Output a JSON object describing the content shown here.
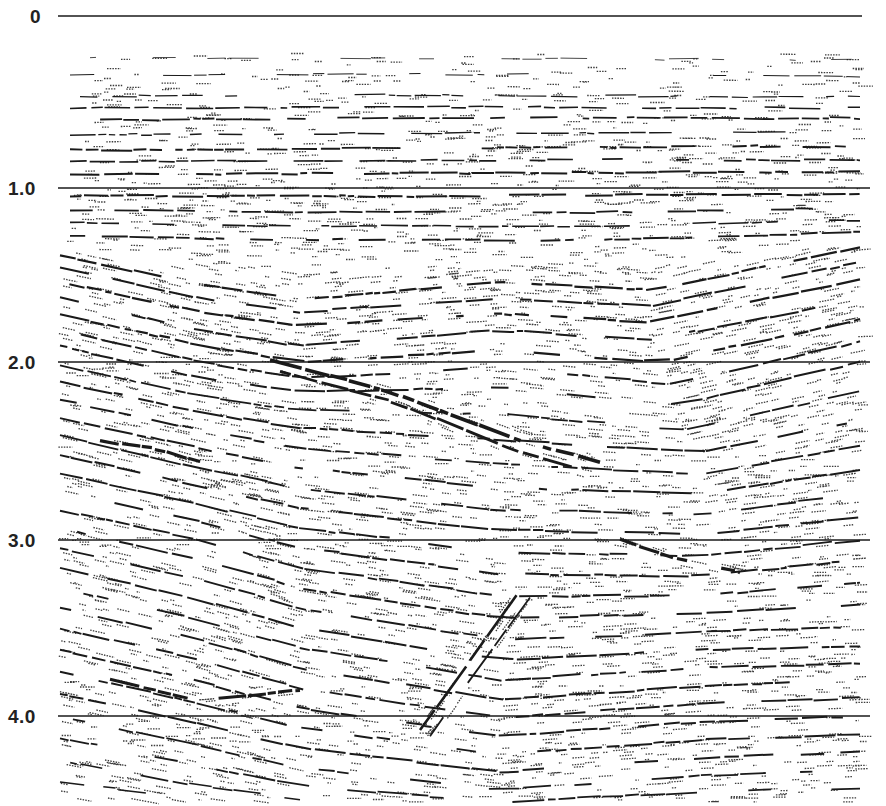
{
  "figure": {
    "type": "seismic-reflection-section",
    "background": "#ffffff",
    "ink": "#1a1a1a",
    "axis": {
      "label_axis": "two-way travel time (s)",
      "ticks": [
        {
          "label": "0",
          "value": 0.0,
          "y": 16,
          "label_x": 30
        },
        {
          "label": "1.0",
          "value": 1.0,
          "y": 188,
          "label_x": 8
        },
        {
          "label": "2.0",
          "value": 2.0,
          "y": 362,
          "label_x": 8
        },
        {
          "label": "3.0",
          "value": 3.0,
          "y": 540,
          "label_x": 8
        },
        {
          "label": "4.0",
          "value": 4.0,
          "y": 716,
          "label_x": 8
        }
      ],
      "timing_line_x": [
        58,
        870
      ],
      "zero_line_x": [
        58,
        862
      ]
    },
    "data_area": {
      "x0": 58,
      "x1": 870,
      "y0": 45,
      "y1": 802
    },
    "zones": [
      {
        "name": "shallow-flat-layers",
        "y_range": [
          45,
          250
        ],
        "dip": "near-horizontal",
        "density": "sparse-to-moderate"
      },
      {
        "name": "dipping-package-left",
        "y_range": [
          250,
          360
        ],
        "dip": "down-to-right"
      },
      {
        "name": "chaotic-central-zone",
        "x_range": [
          280,
          560
        ],
        "y_range": [
          230,
          350
        ]
      },
      {
        "name": "strong-dipping-reflector",
        "from": [
          390,
          395
        ],
        "to": [
          600,
          460
        ]
      },
      {
        "name": "deep-cross-cutting-event",
        "from": [
          420,
          730
        ],
        "to": [
          520,
          590
        ]
      }
    ],
    "horizons": [
      {
        "pts": [
          [
            90,
            58
          ],
          [
            400,
            58
          ],
          [
            860,
            60
          ]
        ],
        "w": 0.8,
        "gap": 0.55
      },
      {
        "pts": [
          [
            70,
            75
          ],
          [
            400,
            74
          ],
          [
            860,
            76
          ]
        ],
        "w": 1.0,
        "gap": 0.45
      },
      {
        "pts": [
          [
            80,
            96
          ],
          [
            400,
            95
          ],
          [
            860,
            97
          ]
        ],
        "w": 1.2,
        "gap": 0.35
      },
      {
        "pts": [
          [
            70,
            108
          ],
          [
            400,
            107
          ],
          [
            860,
            108
          ]
        ],
        "w": 1.6,
        "gap": 0.25
      },
      {
        "pts": [
          [
            70,
            120
          ],
          [
            400,
            118
          ],
          [
            860,
            118
          ]
        ],
        "w": 1.8,
        "gap": 0.2
      },
      {
        "pts": [
          [
            70,
            135
          ],
          [
            400,
            133
          ],
          [
            860,
            132
          ]
        ],
        "w": 1.4,
        "gap": 0.3
      },
      {
        "pts": [
          [
            70,
            150
          ],
          [
            400,
            148
          ],
          [
            860,
            146
          ]
        ],
        "w": 1.9,
        "gap": 0.2
      },
      {
        "pts": [
          [
            70,
            162
          ],
          [
            400,
            160
          ],
          [
            860,
            160
          ]
        ],
        "w": 1.7,
        "gap": 0.22
      },
      {
        "pts": [
          [
            70,
            175
          ],
          [
            400,
            173
          ],
          [
            860,
            172
          ]
        ],
        "w": 2.0,
        "gap": 0.15
      },
      {
        "pts": [
          [
            70,
            196
          ],
          [
            400,
            196
          ],
          [
            860,
            194
          ]
        ],
        "w": 2.0,
        "gap": 0.15
      },
      {
        "pts": [
          [
            70,
            210
          ],
          [
            300,
            212
          ],
          [
            600,
            212
          ],
          [
            860,
            208
          ]
        ],
        "w": 1.8,
        "gap": 0.2
      },
      {
        "pts": [
          [
            70,
            222
          ],
          [
            300,
            226
          ],
          [
            600,
            226
          ],
          [
            860,
            220
          ]
        ],
        "w": 1.6,
        "gap": 0.25
      },
      {
        "pts": [
          [
            70,
            236
          ],
          [
            300,
            240
          ],
          [
            600,
            240
          ],
          [
            860,
            232
          ]
        ],
        "w": 1.9,
        "gap": 0.2
      },
      {
        "pts": [
          [
            60,
            255
          ],
          [
            200,
            285
          ],
          [
            300,
            300
          ],
          [
            500,
            282
          ],
          [
            650,
            290
          ],
          [
            860,
            248
          ]
        ],
        "w": 2.2,
        "gap": 0.2
      },
      {
        "pts": [
          [
            60,
            268
          ],
          [
            200,
            298
          ],
          [
            300,
            312
          ],
          [
            500,
            298
          ],
          [
            650,
            306
          ],
          [
            860,
            262
          ]
        ],
        "w": 2.0,
        "gap": 0.25
      },
      {
        "pts": [
          [
            60,
            282
          ],
          [
            200,
            312
          ],
          [
            300,
            326
          ],
          [
            500,
            314
          ],
          [
            650,
            322
          ],
          [
            860,
            280
          ]
        ],
        "w": 2.2,
        "gap": 0.2
      },
      {
        "pts": [
          [
            60,
            298
          ],
          [
            200,
            330
          ],
          [
            300,
            346
          ],
          [
            500,
            330
          ],
          [
            650,
            340
          ],
          [
            860,
            300
          ]
        ],
        "w": 2.0,
        "gap": 0.25
      },
      {
        "pts": [
          [
            60,
            315
          ],
          [
            200,
            345
          ],
          [
            300,
            362
          ],
          [
            500,
            350
          ],
          [
            660,
            362
          ],
          [
            860,
            320
          ]
        ],
        "w": 2.2,
        "gap": 0.2
      },
      {
        "pts": [
          [
            60,
            330
          ],
          [
            200,
            362
          ],
          [
            300,
            378
          ],
          [
            500,
            368
          ],
          [
            670,
            384
          ],
          [
            860,
            342
          ]
        ],
        "w": 2.0,
        "gap": 0.25
      },
      {
        "pts": [
          [
            60,
            346
          ],
          [
            200,
            378
          ],
          [
            300,
            392
          ],
          [
            500,
            388
          ],
          [
            680,
            404
          ],
          [
            860,
            362
          ]
        ],
        "w": 2.0,
        "gap": 0.25
      },
      {
        "pts": [
          [
            270,
            360
          ],
          [
            390,
            392
          ],
          [
            520,
            440
          ],
          [
            600,
            462
          ]
        ],
        "w": 3.6,
        "gap": 0.05
      },
      {
        "pts": [
          [
            280,
            372
          ],
          [
            400,
            404
          ],
          [
            520,
            452
          ],
          [
            590,
            472
          ]
        ],
        "w": 2.8,
        "gap": 0.1
      },
      {
        "pts": [
          [
            60,
            365
          ],
          [
            200,
            396
          ],
          [
            300,
            410
          ],
          [
            500,
            414
          ],
          [
            680,
            430
          ],
          [
            860,
            392
          ]
        ],
        "w": 1.8,
        "gap": 0.3
      },
      {
        "pts": [
          [
            60,
            382
          ],
          [
            200,
            412
          ],
          [
            300,
            428
          ],
          [
            500,
            440
          ],
          [
            700,
            452
          ],
          [
            860,
            420
          ]
        ],
        "w": 2.0,
        "gap": 0.25
      },
      {
        "pts": [
          [
            60,
            400
          ],
          [
            200,
            430
          ],
          [
            300,
            448
          ],
          [
            500,
            464
          ],
          [
            700,
            474
          ],
          [
            860,
            446
          ]
        ],
        "w": 1.9,
        "gap": 0.3
      },
      {
        "pts": [
          [
            60,
            418
          ],
          [
            200,
            448
          ],
          [
            300,
            468
          ],
          [
            500,
            488
          ],
          [
            700,
            494
          ],
          [
            860,
            470
          ]
        ],
        "w": 2.0,
        "gap": 0.25
      },
      {
        "pts": [
          [
            100,
            440
          ],
          [
            160,
            450
          ],
          [
            200,
            462
          ]
        ],
        "w": 3.2,
        "gap": 0.1
      },
      {
        "pts": [
          [
            60,
            436
          ],
          [
            200,
            468
          ],
          [
            300,
            488
          ],
          [
            500,
            510
          ],
          [
            700,
            514
          ],
          [
            860,
            494
          ]
        ],
        "w": 1.9,
        "gap": 0.3
      },
      {
        "pts": [
          [
            60,
            455
          ],
          [
            200,
            486
          ],
          [
            300,
            508
          ],
          [
            500,
            530
          ],
          [
            700,
            534
          ],
          [
            860,
            518
          ]
        ],
        "w": 2.0,
        "gap": 0.25
      },
      {
        "pts": [
          [
            60,
            474
          ],
          [
            200,
            504
          ],
          [
            300,
            528
          ],
          [
            500,
            552
          ],
          [
            700,
            556
          ],
          [
            860,
            540
          ]
        ],
        "w": 1.9,
        "gap": 0.3
      },
      {
        "pts": [
          [
            60,
            492
          ],
          [
            200,
            522
          ],
          [
            300,
            548
          ],
          [
            500,
            574
          ],
          [
            700,
            576
          ],
          [
            860,
            560
          ]
        ],
        "w": 2.0,
        "gap": 0.25
      },
      {
        "pts": [
          [
            620,
            540
          ],
          [
            680,
            560
          ],
          [
            740,
            572
          ]
        ],
        "w": 3.2,
        "gap": 0.1
      },
      {
        "pts": [
          [
            60,
            510
          ],
          [
            200,
            540
          ],
          [
            300,
            568
          ],
          [
            500,
            596
          ],
          [
            700,
            596
          ],
          [
            860,
            582
          ]
        ],
        "w": 1.9,
        "gap": 0.3
      },
      {
        "pts": [
          [
            60,
            528
          ],
          [
            200,
            560
          ],
          [
            300,
            588
          ],
          [
            500,
            618
          ],
          [
            700,
            614
          ],
          [
            860,
            604
          ]
        ],
        "w": 2.0,
        "gap": 0.25
      },
      {
        "pts": [
          [
            60,
            548
          ],
          [
            200,
            580
          ],
          [
            300,
            608
          ],
          [
            500,
            640
          ],
          [
            700,
            632
          ],
          [
            860,
            626
          ]
        ],
        "w": 1.9,
        "gap": 0.3
      },
      {
        "pts": [
          [
            60,
            568
          ],
          [
            200,
            600
          ],
          [
            300,
            628
          ],
          [
            500,
            660
          ],
          [
            700,
            650
          ],
          [
            860,
            646
          ]
        ],
        "w": 2.0,
        "gap": 0.25
      },
      {
        "pts": [
          [
            60,
            588
          ],
          [
            200,
            620
          ],
          [
            300,
            648
          ],
          [
            500,
            680
          ],
          [
            700,
            668
          ],
          [
            860,
            664
          ]
        ],
        "w": 1.9,
        "gap": 0.3
      },
      {
        "pts": [
          [
            60,
            608
          ],
          [
            200,
            640
          ],
          [
            300,
            668
          ],
          [
            500,
            700
          ],
          [
            700,
            686
          ],
          [
            860,
            680
          ]
        ],
        "w": 2.0,
        "gap": 0.25
      },
      {
        "pts": [
          [
            420,
            730
          ],
          [
            470,
            660
          ],
          [
            520,
            590
          ]
        ],
        "w": 2.6,
        "gap": 0.1
      },
      {
        "pts": [
          [
            430,
            736
          ],
          [
            480,
            666
          ],
          [
            530,
            598
          ]
        ],
        "w": 1.8,
        "gap": 0.2
      },
      {
        "pts": [
          [
            110,
            680
          ],
          [
            200,
            700
          ],
          [
            300,
            690
          ]
        ],
        "w": 3.0,
        "gap": 0.1
      },
      {
        "pts": [
          [
            60,
            628
          ],
          [
            200,
            660
          ],
          [
            300,
            688
          ],
          [
            500,
            718
          ],
          [
            700,
            704
          ],
          [
            860,
            698
          ]
        ],
        "w": 1.9,
        "gap": 0.3
      },
      {
        "pts": [
          [
            60,
            650
          ],
          [
            200,
            682
          ],
          [
            300,
            708
          ],
          [
            500,
            736
          ],
          [
            700,
            722
          ],
          [
            860,
            716
          ]
        ],
        "w": 2.0,
        "gap": 0.25
      },
      {
        "pts": [
          [
            60,
            672
          ],
          [
            200,
            704
          ],
          [
            300,
            728
          ],
          [
            500,
            754
          ],
          [
            700,
            740
          ],
          [
            860,
            734
          ]
        ],
        "w": 1.9,
        "gap": 0.3
      },
      {
        "pts": [
          [
            60,
            694
          ],
          [
            200,
            724
          ],
          [
            300,
            748
          ],
          [
            500,
            772
          ],
          [
            700,
            758
          ],
          [
            860,
            752
          ]
        ],
        "w": 2.0,
        "gap": 0.3
      },
      {
        "pts": [
          [
            60,
            716
          ],
          [
            200,
            746
          ],
          [
            300,
            768
          ],
          [
            500,
            790
          ],
          [
            700,
            776
          ],
          [
            860,
            770
          ]
        ],
        "w": 1.8,
        "gap": 0.35
      },
      {
        "pts": [
          [
            60,
            738
          ],
          [
            200,
            766
          ],
          [
            300,
            786
          ],
          [
            500,
            802
          ],
          [
            700,
            792
          ],
          [
            860,
            788
          ]
        ],
        "w": 1.8,
        "gap": 0.35
      },
      {
        "pts": [
          [
            60,
            760
          ],
          [
            200,
            786
          ],
          [
            300,
            800
          ]
        ],
        "w": 1.6,
        "gap": 0.4
      },
      {
        "pts": [
          [
            60,
            782
          ],
          [
            200,
            800
          ]
        ],
        "w": 1.5,
        "gap": 0.4
      }
    ],
    "fill_density": 1400,
    "seed": 7
  }
}
